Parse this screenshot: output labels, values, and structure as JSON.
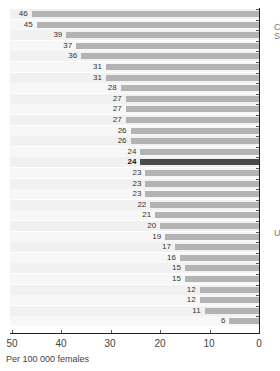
{
  "chart_data": {
    "type": "bar",
    "orientation": "horizontal",
    "direction": "right-to-left",
    "title": "",
    "xlabel": "Per 100 000 females",
    "ylabel": "",
    "xlim": [
      50,
      0
    ],
    "xticks": [
      "50",
      "40",
      "30",
      "20",
      "10",
      "0"
    ],
    "values": [
      46,
      45,
      39,
      37,
      36,
      31,
      31,
      28,
      27,
      27,
      27,
      26,
      26,
      24,
      24,
      23,
      23,
      23,
      22,
      21,
      20,
      19,
      17,
      16,
      15,
      15,
      12,
      12,
      11,
      6
    ],
    "highlight_index": 14,
    "colors": {
      "bar": "#b3b3b3",
      "highlight": "#4a4a4a"
    },
    "categories_visible": false
  },
  "axis": {
    "xlabel": "Per 100 000 females",
    "ticks": [
      "50",
      "40",
      "30",
      "20",
      "10",
      "0"
    ]
  },
  "clipped_text": [
    "C",
    "S",
    "U"
  ]
}
